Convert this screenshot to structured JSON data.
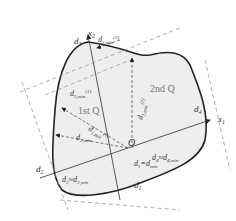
{
  "diagram": {
    "origin_label": "O",
    "axes": {
      "x1": "x",
      "x1_sub": "1",
      "x2": "x",
      "x2_sub": "2"
    },
    "quadrants": {
      "first": "1st Q",
      "second": "2nd Q"
    },
    "tangent_labels": {
      "d1": "d",
      "d1_sub": "1",
      "d2": "d",
      "d2_sub": "2",
      "d3": "d",
      "d3_sub": "3",
      "d4": "d",
      "d4_sub": "4"
    },
    "distance_labels": {
      "d3_min_2": "d3,min(2)",
      "d3_min_1": "d3,min(1)",
      "d1_min_2": "d1,min(2)",
      "d1_min_1": "d1,min(1)",
      "d2_min": "d2,min",
      "d2_eq": "d2≈d2,min",
      "d4_eq": "d4≈d4,min",
      "d1_eq": "d1=dmin"
    },
    "colors": {
      "fill": "#eeeeee",
      "outline": "#222222",
      "dashed": "#888888",
      "text": "#333333"
    }
  }
}
